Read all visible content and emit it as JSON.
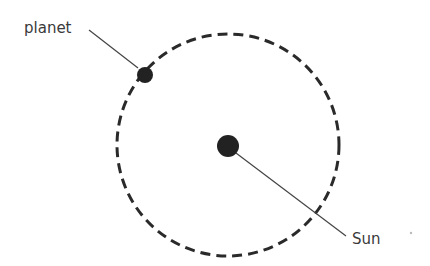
{
  "diagram": {
    "labels": {
      "planet": "planet",
      "sun": "Sun"
    },
    "colors": {
      "orbit": "#2a2a2a",
      "bodies": "#222222",
      "text": "#3a3a3a",
      "leader": "#444444"
    },
    "orbit": {
      "cx": 228,
      "cy": 145,
      "r": 111
    },
    "sun": {
      "cx": 228,
      "cy": 145,
      "r": 11
    },
    "planet": {
      "cx": 145,
      "cy": 75,
      "r": 8
    }
  }
}
